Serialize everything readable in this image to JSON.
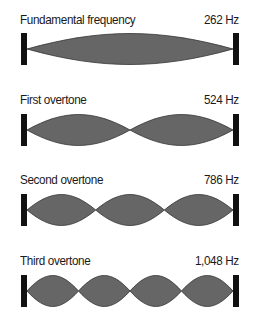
{
  "colors": {
    "wave_fill": "#666666",
    "wave_stroke": "#333333",
    "bar": "#111111",
    "text": "#1a1a1a"
  },
  "rows": [
    {
      "label": "Fundamental frequency",
      "frequency": "262 Hz",
      "loops": 1
    },
    {
      "label": "First overtone",
      "frequency": "524 Hz",
      "loops": 2
    },
    {
      "label": "Second overtone",
      "frequency": "786 Hz",
      "loops": 3
    },
    {
      "label": "Third overtone",
      "frequency": "1,048 Hz",
      "loops": 4
    }
  ]
}
